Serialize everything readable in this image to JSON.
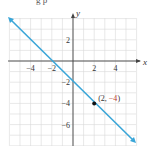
{
  "header_fragment": "g  p",
  "chart_data": {
    "type": "line",
    "title": "",
    "xlabel": "x",
    "ylabel": "y",
    "xlim": [
      -6,
      6
    ],
    "ylim": [
      -8,
      4
    ],
    "grid": true,
    "x_ticks": [
      -4,
      -2,
      2,
      4
    ],
    "y_ticks": [
      2,
      -2,
      -4,
      -6
    ],
    "x_tick_labels": [
      "−4",
      "−2",
      "2",
      "4"
    ],
    "y_tick_labels": [
      "2",
      "−2",
      "−4",
      "−6"
    ],
    "series": [
      {
        "name": "y = -x - 2",
        "color": "#3aa6d8",
        "x": [
          -6,
          -2,
          0,
          2,
          6
        ],
        "y": [
          4,
          0,
          -2,
          -4,
          -8
        ],
        "arrows": "both"
      }
    ],
    "points": [
      {
        "x": 2,
        "y": -4,
        "label": "(2, −4)",
        "label_x": "2",
        "label_y": "−4",
        "label_y_color": "#c0392b"
      }
    ]
  },
  "colors": {
    "line": "#3aa6d8",
    "grid": "#d8d8d8",
    "axis": "#444444",
    "point": "#111111",
    "label": "#444444",
    "label_accent": "#c0392b"
  }
}
